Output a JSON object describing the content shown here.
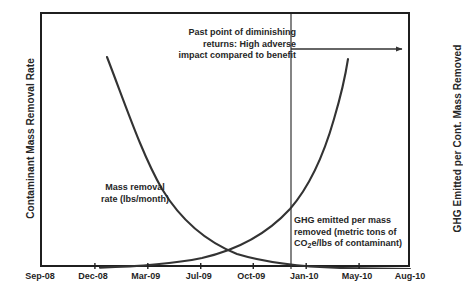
{
  "chart_data": {
    "type": "line",
    "title": "",
    "xlabel": "",
    "ylabel": "Contaminant Mass Removal Rate",
    "y2label": "GHG Emitted per Cont. Mass Removed",
    "grid": false,
    "legend_position": "inline-annotations",
    "x_tick_labels": [
      "Sep-08",
      "Dec-08",
      "Mar-09",
      "Jul-09",
      "Oct-09",
      "Jan-10",
      "May-10",
      "Aug-10"
    ],
    "x_tick_fractions": [
      0.0,
      0.143,
      0.286,
      0.429,
      0.571,
      0.714,
      0.857,
      1.0
    ],
    "xlim": [
      "Sep-08",
      "Aug-10"
    ],
    "ylim": [
      0,
      100
    ],
    "series": [
      {
        "name": "Mass removal rate (lbs/month)",
        "axis": "left",
        "shape": "exponential-decay",
        "x": [
          0.175,
          0.22,
          0.27,
          0.32,
          0.37,
          0.42,
          0.47,
          0.52,
          0.57,
          0.62,
          0.67,
          0.72,
          0.78,
          0.84,
          0.9,
          0.95
        ],
        "values": [
          83,
          70,
          57,
          46,
          37,
          29,
          23,
          18,
          14,
          11,
          8,
          6,
          4,
          2.5,
          1.5,
          0.8
        ]
      },
      {
        "name": "GHG emitted per mass removed (metric tons of CO2e/lbs of contaminant)",
        "axis": "right",
        "shape": "exponential-growth",
        "x": [
          0.175,
          0.24,
          0.3,
          0.36,
          0.42,
          0.48,
          0.53,
          0.58,
          0.63,
          0.68,
          0.73,
          0.78,
          0.81,
          0.84,
          0.825
        ],
        "values": [
          0.6,
          1.2,
          2.0,
          3.2,
          4.8,
          7.0,
          9.5,
          13,
          18,
          25,
          35,
          50,
          62,
          76,
          82
        ]
      }
    ],
    "annotations": [
      {
        "name": "diminishing-returns",
        "text": "Past point of diminishing returns: High adverse impact compared to benefit",
        "lines": [
          "Past point of diminishing",
          "returns: High adverse",
          "impact compared to benefit"
        ]
      },
      {
        "name": "threshold-marker",
        "type": "vertical-line",
        "x_fraction": 0.673
      },
      {
        "name": "adverse-region-arrow",
        "type": "arrow",
        "direction": "right",
        "from_x_fraction": 0.673,
        "to_x_fraction": 0.985,
        "y_fraction": 0.137
      }
    ]
  },
  "axes": {
    "left_title": "Contaminant Mass Removal Rate",
    "right_title": "GHG Emitted per Cont. Mass Removed",
    "x_ticks": [
      {
        "label": "Sep-08",
        "fraction": 0.0
      },
      {
        "label": "Dec-08",
        "fraction": 0.143
      },
      {
        "label": "Mar-09",
        "fraction": 0.286
      },
      {
        "label": "Jul-09",
        "fraction": 0.429
      },
      {
        "label": "Oct-09",
        "fraction": 0.571
      },
      {
        "label": "Jan-10",
        "fraction": 0.714
      },
      {
        "label": "May-10",
        "fraction": 0.857
      },
      {
        "label": "Aug-10",
        "fraction": 1.0
      }
    ]
  },
  "labels": {
    "diminishing_line1": "Past point of diminishing",
    "diminishing_line2": "returns: High adverse",
    "diminishing_line3": "impact compared to benefit",
    "mass_removal_line1": "Mass removal",
    "mass_removal_line2": "rate (lbs/month)",
    "ghg_line1": "GHG emitted per mass",
    "ghg_line2": "removed (metric tons of",
    "ghg_line3_pre": "CO",
    "ghg_line3_sub": "2",
    "ghg_line3_post": "e/lbs of contaminant)"
  },
  "colors": {
    "curve": "#333333",
    "frame": "#1f1f1f",
    "text": "#262626",
    "background": "#ffffff"
  }
}
